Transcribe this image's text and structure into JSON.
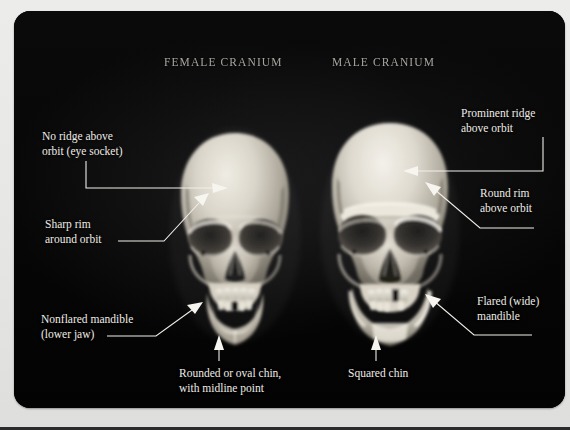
{
  "figure": {
    "background_color": "#050505",
    "page_color": "#e8e8e6",
    "text_color": "#efece6",
    "titles": {
      "female": "FEMALE CRANIUM",
      "male": "MALE CRANIUM"
    },
    "callouts": [
      {
        "id": "no-ridge",
        "side": "left",
        "text": "No ridge above\norbit (eye socket)",
        "target": "female-frontal-bone-above-orbit"
      },
      {
        "id": "sharp-rim",
        "side": "left",
        "text": "Sharp rim\naround orbit",
        "target": "female-orbit-superior-margin"
      },
      {
        "id": "nonflared-mandible",
        "side": "left",
        "text": "Nonflared mandible\n(lower jaw)",
        "target": "female-mandible-angle"
      },
      {
        "id": "rounded-chin",
        "side": "bottom",
        "text": "Rounded or oval chin,\nwith midline point",
        "target": "female-mental-eminence"
      },
      {
        "id": "squared-chin",
        "side": "bottom",
        "text": "Squared chin",
        "target": "male-mental-eminence"
      },
      {
        "id": "prominent-ridge",
        "side": "right",
        "text": "Prominent ridge\nabove orbit",
        "target": "male-supraorbital-ridge"
      },
      {
        "id": "round-rim",
        "side": "right",
        "text": "Round rim\nabove orbit",
        "target": "male-orbit-superior-margin"
      },
      {
        "id": "flared-mandible",
        "side": "right",
        "text": "Flared (wide)\nmandible",
        "target": "male-mandible-angle"
      }
    ],
    "specimens": [
      {
        "id": "female-cranium",
        "label": "FEMALE CRANIUM"
      },
      {
        "id": "male-cranium",
        "label": "MALE CRANIUM"
      }
    ]
  }
}
